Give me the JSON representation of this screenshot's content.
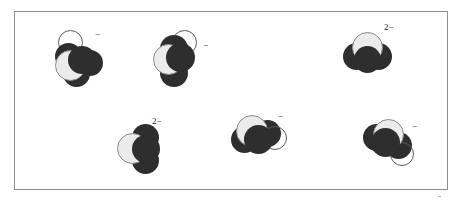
{
  "figure": {
    "background_color": "#ffffff",
    "frame": {
      "border_color": "#8e8e92",
      "fill_color": "#ffffff"
    },
    "palette": {
      "dark_atom": "#2e2e2e",
      "light_atom": "#ebebeb",
      "light_atom_outline": "#8a8a8a",
      "hollow_atom_outline": "#5a5a5a",
      "label_color": "#1a1a1a"
    },
    "molecules": [
      {
        "id": "molecule-1",
        "charge_label": "−",
        "charge_number": "",
        "charge_sign": "−",
        "atoms": [
          {
            "role": "hollow-atom",
            "shade": "hollow"
          },
          {
            "role": "dark-atom-upper",
            "shade": "dark"
          },
          {
            "role": "dark-atom-right",
            "shade": "dark"
          },
          {
            "role": "dark-atom-lower",
            "shade": "dark"
          },
          {
            "role": "light-atom-center",
            "shade": "light"
          },
          {
            "role": "dark-atom-center",
            "shade": "dark"
          }
        ]
      },
      {
        "id": "molecule-2",
        "charge_label": "−",
        "charge_number": "",
        "charge_sign": "−",
        "atoms": [
          {
            "role": "hollow-atom",
            "shade": "hollow"
          },
          {
            "role": "dark-atom-upper",
            "shade": "dark"
          },
          {
            "role": "dark-atom-lower",
            "shade": "dark"
          },
          {
            "role": "light-atom-center",
            "shade": "light"
          },
          {
            "role": "dark-atom-center",
            "shade": "dark"
          }
        ]
      },
      {
        "id": "molecule-3",
        "charge_label": "2−",
        "charge_number": "2",
        "charge_sign": "−",
        "atoms": [
          {
            "role": "dark-atom-left",
            "shade": "dark"
          },
          {
            "role": "dark-atom-right",
            "shade": "dark"
          },
          {
            "role": "light-atom-top",
            "shade": "light"
          },
          {
            "role": "dark-atom-center",
            "shade": "dark"
          }
        ]
      },
      {
        "id": "molecule-4",
        "charge_label": "2−",
        "charge_number": "2",
        "charge_sign": "−",
        "atoms": [
          {
            "role": "dark-atom-upper",
            "shade": "dark"
          },
          {
            "role": "dark-atom-lower",
            "shade": "dark"
          },
          {
            "role": "light-atom-left",
            "shade": "light"
          },
          {
            "role": "dark-atom-center",
            "shade": "dark"
          }
        ]
      },
      {
        "id": "molecule-5",
        "charge_label": "−",
        "charge_number": "",
        "charge_sign": "−",
        "atoms": [
          {
            "role": "dark-atom-left",
            "shade": "dark"
          },
          {
            "role": "dark-atom-right",
            "shade": "dark"
          },
          {
            "role": "hollow-atom",
            "shade": "hollow"
          },
          {
            "role": "light-atom-top",
            "shade": "light"
          },
          {
            "role": "dark-atom-center",
            "shade": "dark"
          }
        ]
      },
      {
        "id": "molecule-6",
        "charge_label": "−",
        "charge_number": "",
        "charge_sign": "−",
        "atoms": [
          {
            "role": "dark-atom-left",
            "shade": "dark"
          },
          {
            "role": "dark-atom-right",
            "shade": "dark"
          },
          {
            "role": "hollow-atom",
            "shade": "hollow"
          },
          {
            "role": "light-atom-top",
            "shade": "light"
          },
          {
            "role": "dark-atom-center",
            "shade": "dark"
          }
        ]
      }
    ]
  }
}
